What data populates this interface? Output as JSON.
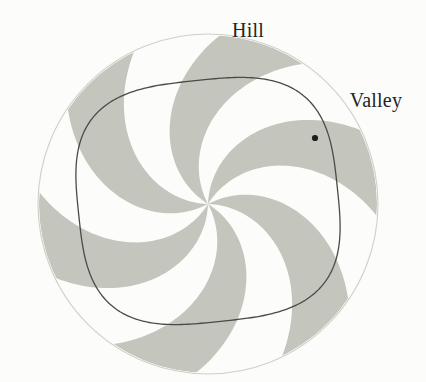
{
  "figure": {
    "background_color": "#fcfcfa",
    "labels": {
      "hill": "Hill",
      "valley": "Valley"
    },
    "label_color": "#242424",
    "label_font_size_px": 20
  },
  "chart_data": {
    "type": "scatter",
    "subtitle": "",
    "xlabel": "",
    "ylabel": "",
    "grid": false,
    "legend_position": "none",
    "annotations": [
      {
        "text": "Hill",
        "x_px": 248,
        "y_px": 30,
        "anchor": "middle",
        "target_region": "upper gray spiral blade"
      },
      {
        "text": "Valley",
        "x_px": 376,
        "y_px": 100,
        "anchor": "middle",
        "target_region": "upper-right white spiral sector"
      }
    ],
    "elements": [
      {
        "name": "outer-circle",
        "kind": "circle",
        "center_px": [
          208,
          204
        ],
        "radius_px": 170,
        "stroke": "#cfd0c8",
        "stroke_width": 1.1,
        "fill": "none"
      },
      {
        "name": "pinwheel-blades",
        "kind": "spiral-sectors",
        "blade_count": 6,
        "fill": "#c4c6bd",
        "center_px": [
          208,
          204
        ],
        "outer_radius_px": 169,
        "twist_degrees": 62,
        "angular_width_degrees": 30,
        "start_angle_degrees": -88,
        "description": "Six gray spiral blades radiating counterclockwise from the center to the outer circle, alternating with six white sectors."
      },
      {
        "name": "inner-curve",
        "kind": "rounded-square-closed-curve",
        "center_px": [
          208,
          201
        ],
        "half_width_px": 130,
        "half_height_px": 121,
        "rotation_degrees": -6,
        "squareness_exponent": 3.1,
        "stroke": "#4a4a46",
        "stroke_width": 1.3,
        "fill": "none",
        "extent_px": {
          "x_min": 78,
          "x_max": 337,
          "y_min": 80,
          "y_max": 320
        }
      },
      {
        "name": "valley-point-marker",
        "kind": "point",
        "position_px": [
          315,
          138
        ],
        "radius_px": 3.1,
        "fill": "#1e1e1e"
      }
    ],
    "colors": {
      "blade_gray": "#c4c6bd",
      "outer_circle_stroke": "#cfd0c8",
      "inner_curve_stroke": "#4a4a46",
      "marker": "#1e1e1e",
      "background": "#fcfcfa",
      "label": "#242424"
    }
  }
}
